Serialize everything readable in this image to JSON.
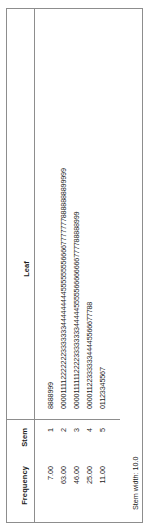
{
  "table": {
    "headers": {
      "frequency": "Frequency",
      "stem": "Stem",
      "leaf": "Leaf"
    },
    "rows": [
      {
        "frequency": "7.00",
        "stem": "1",
        "leaf": "8888999"
      },
      {
        "frequency": "63.00",
        "stem": "2",
        "leaf": "000011112222222333333344444444455555555666677777778888888899999"
      },
      {
        "frequency": "46.00",
        "stem": "3",
        "leaf": "0000111111222233333333444445555566666666777788888999"
      },
      {
        "frequency": "25.00",
        "stem": "4",
        "leaf": "0000112233333344445566677788"
      },
      {
        "frequency": "11.00",
        "stem": "5",
        "leaf": "01123345567"
      }
    ],
    "footer": "Stem width: 10.0"
  },
  "chart_data": {
    "type": "table",
    "title": "",
    "columns": [
      "Frequency",
      "Stem",
      "Leaf"
    ],
    "rows": [
      [
        "7.00",
        "1",
        "8888999"
      ],
      [
        "63.00",
        "2",
        "000011112222222333333344444444455555555666677777778888888899999"
      ],
      [
        "46.00",
        "3",
        "0000111111222233333333444445555566666666777788888999"
      ],
      [
        "25.00",
        "4",
        "0000112233333344445566677788"
      ],
      [
        "11.00",
        "5",
        "01123345567"
      ]
    ],
    "annotations": [
      "Stem width: 10.0"
    ],
    "frequencies": [
      7,
      63,
      46,
      25,
      11
    ],
    "stems": [
      1,
      2,
      3,
      4,
      5
    ],
    "stem_width": 10.0
  }
}
